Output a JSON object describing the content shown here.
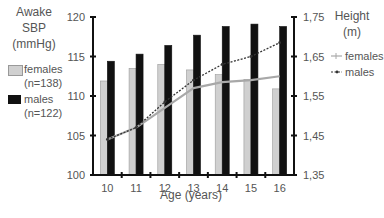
{
  "chart_data": {
    "type": "bar",
    "title": "",
    "xlabel": "Age (years)",
    "categories": [
      "10",
      "11",
      "12",
      "13",
      "14",
      "15",
      "16"
    ],
    "left_axis": {
      "label_lines": [
        "Awake",
        "SBP",
        "(mmHg)"
      ],
      "ylim": [
        100,
        120
      ],
      "ticks": [
        "100",
        "105",
        "110",
        "115",
        "120"
      ]
    },
    "right_axis": {
      "label_lines": [
        "Height",
        "(m)"
      ],
      "ylim": [
        1.35,
        1.75
      ],
      "ticks": [
        "1,35",
        "1,45",
        "1,55",
        "1,65",
        "1,75"
      ]
    },
    "series": [
      {
        "name": "females",
        "sub": "(n=138)",
        "kind": "bar",
        "axis": "left",
        "color": "#d0d0d0",
        "values": [
          111.9,
          113.5,
          114.0,
          113.3,
          112.7,
          112.1,
          110.9
        ]
      },
      {
        "name": "males",
        "sub": "(n=122)",
        "kind": "bar",
        "axis": "left",
        "color": "#111111",
        "values": [
          114.4,
          115.3,
          116.4,
          117.7,
          118.8,
          119.1,
          118.8
        ]
      },
      {
        "name": "females",
        "kind": "line",
        "axis": "right",
        "color": "#a8a8a8",
        "values": [
          1.44,
          1.47,
          1.52,
          1.57,
          1.585,
          1.59,
          1.6
        ]
      },
      {
        "name": "males",
        "kind": "line",
        "axis": "right",
        "color": "#333333",
        "dashed": true,
        "values": [
          1.44,
          1.47,
          1.535,
          1.59,
          1.63,
          1.65,
          1.685
        ]
      }
    ],
    "legend_left": [
      {
        "label": "females",
        "sub": "(n=138)"
      },
      {
        "label": "males",
        "sub": "(n=122)"
      }
    ],
    "legend_right": [
      {
        "label": "females"
      },
      {
        "label": "males"
      }
    ],
    "grid": false
  }
}
